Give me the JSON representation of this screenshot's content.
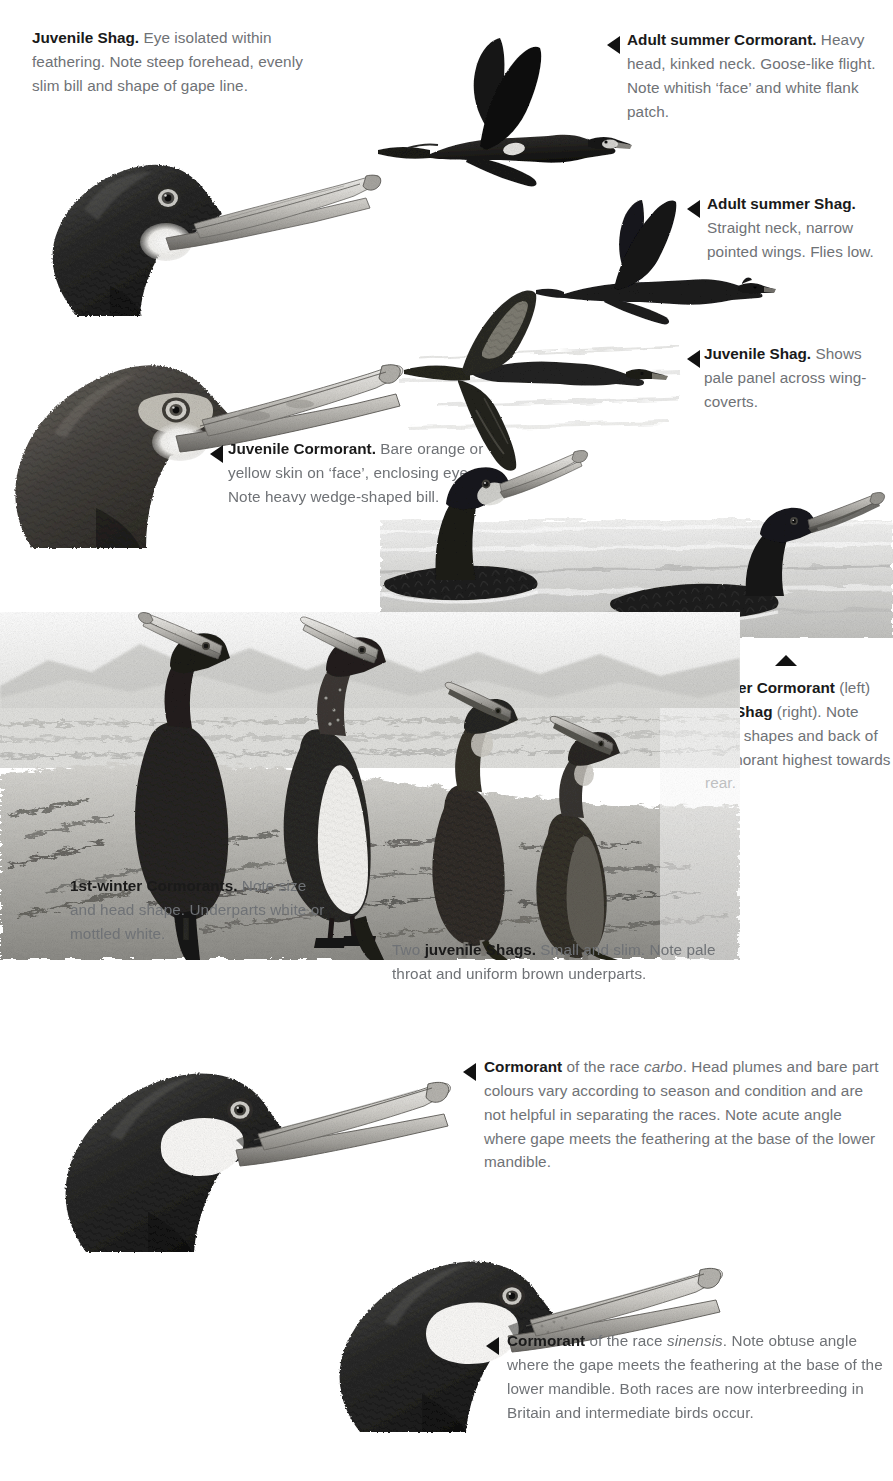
{
  "plate": {
    "title": "Cormorant and Shag identification plate",
    "ink_color": "#6f7276",
    "heading_color": "#1a1a1a",
    "marker_color": "#111111",
    "background": "#ffffff"
  },
  "captions": {
    "juvenile_shag_head": {
      "lead": "Juvenile Shag.",
      "body": " Eye isolated within feathering. Note steep forehead, evenly slim bill and shape of gape line."
    },
    "adult_summer_cormorant": {
      "lead": "Adult summer Cormorant.",
      "body": " Heavy head, kinked neck. Goose-like flight. Note whitish ‘face’ and white flank patch."
    },
    "adult_summer_shag": {
      "lead": "Adult summer Shag.",
      "body": " Straight neck, narrow pointed wings. Flies low."
    },
    "juvenile_shag_flight": {
      "lead": "Juvenile Shag.",
      "body": " Shows pale panel across wing-coverts."
    },
    "juvenile_cormorant_head": {
      "lead": "Juvenile Cormorant.",
      "body": " Bare orange or yellow skin on ‘face’, enclosing eye. Note heavy wedge-shaped bill."
    },
    "winter_cormorant_shag": {
      "lead": "Winter Cormorant",
      "mid1": " (left) and ",
      "lead2": "Shag",
      "body": " (right). Note head shapes and back of Cormorant highest towards rear."
    },
    "first_winter_cormorants": {
      "lead": "1st-winter Cormorants.",
      "body": " Note size and head shape. Underparts white or mottled white."
    },
    "two_juvenile_shags": {
      "pre": "Two ",
      "lead": "juvenile Shags.",
      "body": " Small and slim. Note pale throat and uniform brown underparts."
    },
    "race_carbo": {
      "lead": "Cormorant",
      "mid1": " of the race ",
      "race": "carbo",
      "body": ". Head plumes and bare part colours vary according to season and condition and are not helpful in separating the races. Note acute angle where gape meets the feathering at the base of the lower mandible."
    },
    "race_sinensis": {
      "lead": "Cormorant",
      "mid1": " of the race ",
      "race": "sinensis",
      "body": ". Note obtuse angle where the gape meets the feathering at the base of the lower mandible. Both races are now interbreeding in Britain and intermediate birds occur."
    }
  },
  "illustrations": [
    {
      "name": "juvenile-shag-head",
      "label": "Juvenile Shag head portrait"
    },
    {
      "name": "adult-summer-cormorant-flight",
      "label": "Adult summer Cormorant in flight"
    },
    {
      "name": "adult-summer-shag-flight",
      "label": "Adult summer Shag in flight"
    },
    {
      "name": "juvenile-shag-flight",
      "label": "Juvenile Shag in flight"
    },
    {
      "name": "juvenile-cormorant-head",
      "label": "Juvenile Cormorant head portrait"
    },
    {
      "name": "swimming-cormorant-and-shag",
      "label": "Winter Cormorant and Shag swimming"
    },
    {
      "name": "shoreline-group",
      "label": "1st-winter Cormorants and juvenile Shags on shore"
    },
    {
      "name": "cormorant-carbo-head",
      "label": "Cormorant race carbo head portrait"
    },
    {
      "name": "cormorant-sinensis-head",
      "label": "Cormorant race sinensis head portrait"
    }
  ],
  "markers": [
    {
      "name": "marker-adult-summer-cormorant",
      "direction": "left"
    },
    {
      "name": "marker-adult-summer-shag",
      "direction": "left"
    },
    {
      "name": "marker-juvenile-shag-flight",
      "direction": "left"
    },
    {
      "name": "marker-juvenile-cormorant-head",
      "direction": "left"
    },
    {
      "name": "marker-winter-cormorant-shag",
      "direction": "up"
    },
    {
      "name": "marker-race-carbo",
      "direction": "left"
    },
    {
      "name": "marker-race-sinensis",
      "direction": "left"
    }
  ]
}
